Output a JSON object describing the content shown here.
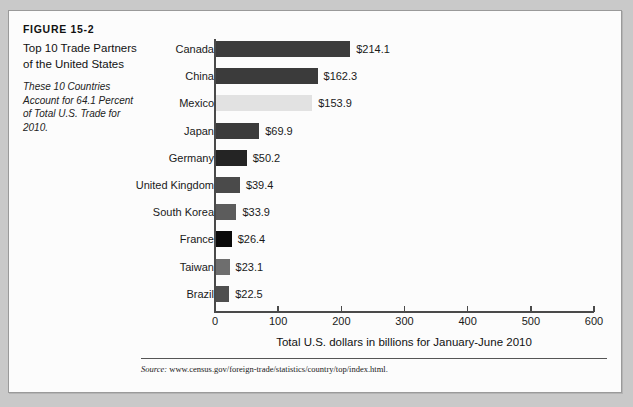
{
  "figure": {
    "number": "FIGURE 15-2",
    "title": "Top 10 Trade Partners of the United States",
    "subtitle": "These 10 Countries Account for 64.1 Percent of Total U.S. Trade for 2010.",
    "source_prefix": "Source:",
    "source_url": "www.census.gov/foreign-trade/statistics/country/top/index.html."
  },
  "chart_data": {
    "type": "bar",
    "orientation": "horizontal",
    "title": "Top 10 Trade Partners of the United States",
    "xlabel": "Total U.S. dollars in billions for January-June 2010",
    "ylabel": "",
    "xlim": [
      0,
      600
    ],
    "xticks": [
      0,
      100,
      200,
      300,
      400,
      500,
      600
    ],
    "xtick_labels": [
      "0",
      "100",
      "200",
      "300",
      "400",
      "500",
      "600"
    ],
    "grid": false,
    "legend": "none",
    "categories": [
      "Canada",
      "China",
      "Mexico",
      "Japan",
      "Germany",
      "United Kingdom",
      "South Korea",
      "France",
      "Taiwan",
      "Brazil"
    ],
    "values": [
      214.1,
      162.3,
      153.9,
      69.9,
      50.2,
      39.4,
      33.9,
      26.4,
      23.1,
      22.5
    ],
    "value_labels": [
      "$214.1",
      "$162.3",
      "$153.9",
      "$69.9",
      "$50.2",
      "$39.4",
      "$33.9",
      "$26.4",
      "$23.1",
      "$22.5"
    ],
    "bar_colors": [
      "#3c3c3c",
      "#3b3b3b",
      "#e2e2e2",
      "#3b3b3b",
      "#242424",
      "#4a4a4a",
      "#5c5c5c",
      "#0a0a0a",
      "#6e6e6e",
      "#4f4f4f"
    ]
  }
}
